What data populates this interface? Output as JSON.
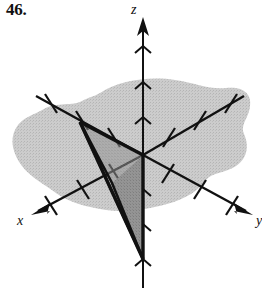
{
  "figure": {
    "problem_number": "46.",
    "axis_labels": {
      "x": "x",
      "y": "y",
      "z": "z"
    },
    "colors": {
      "ink": "#111111",
      "plane_fill": "#c9c9c9",
      "triangle_fill": "#8f8f8f",
      "background": "#ffffff"
    },
    "origin": {
      "x": 143,
      "y": 155
    },
    "axes": [
      {
        "name": "z-axis",
        "direction": "up",
        "from": {
          "x": 143,
          "y": 286
        },
        "to": {
          "x": 143,
          "y": 18
        },
        "arrow_at": "to",
        "tick_positions": [
          48,
          83,
          118,
          190,
          225,
          260
        ]
      },
      {
        "name": "x-axis",
        "direction": "lower-left",
        "from": {
          "x": 143,
          "y": 155
        },
        "to": {
          "x": 33,
          "y": 214
        },
        "arrow_at": "to",
        "tick_count": 3
      },
      {
        "name": "y-axis",
        "direction": "lower-right",
        "from": {
          "x": 143,
          "y": 155
        },
        "to": {
          "x": 251,
          "y": 213
        },
        "arrow_at": "to",
        "tick_count": 3
      },
      {
        "name": "negative-x-axis",
        "direction": "upper-right",
        "from": {
          "x": 143,
          "y": 155
        },
        "to": {
          "x": 244,
          "y": 96
        },
        "arrow_at": "none",
        "tick_count": 3
      },
      {
        "name": "negative-y-axis",
        "direction": "upper-left",
        "from": {
          "x": 143,
          "y": 155
        },
        "to": {
          "x": 36,
          "y": 96
        },
        "arrow_at": "none",
        "tick_count": 3
      }
    ],
    "triangle": {
      "vertices": [
        {
          "name": "vertex-on-negative-y-axis",
          "x": 80,
          "y": 122
        },
        {
          "name": "vertex-at-origin",
          "x": 143,
          "y": 155
        },
        {
          "name": "vertex-on-negative-z-axis",
          "x": 143,
          "y": 259
        }
      ],
      "inner_fold_point": {
        "x": 112,
        "y": 183
      }
    }
  }
}
